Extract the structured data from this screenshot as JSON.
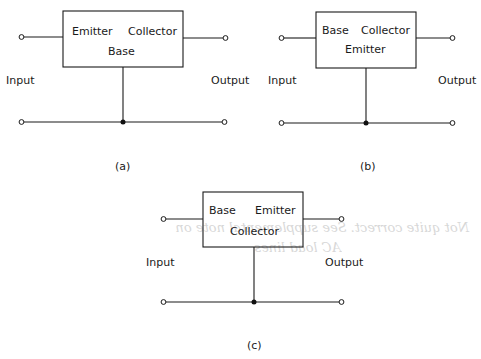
{
  "figure": {
    "panels": [
      {
        "id": "a",
        "caption": "(a)",
        "box_top_left": "Emitter",
        "box_top_right": "Collector",
        "box_center": "Base",
        "input_label": "Input",
        "output_label": "Output"
      },
      {
        "id": "b",
        "caption": "(b)",
        "box_top_left": "Base",
        "box_top_right": "Collector",
        "box_center": "Emitter",
        "input_label": "Input",
        "output_label": "Output"
      },
      {
        "id": "c",
        "caption": "(c)",
        "box_top_left": "Base",
        "box_top_right": "Emitter",
        "box_center": "Collector",
        "input_label": "Input",
        "output_label": "Output"
      }
    ],
    "bleed_through_note": {
      "line1": "Not quite correct. See supplemental note on",
      "line2": "AC load lines"
    },
    "colors": {
      "ink": "#1a1a1a",
      "background": "#ffffff",
      "bleed_through": "#b8b8b8"
    }
  }
}
